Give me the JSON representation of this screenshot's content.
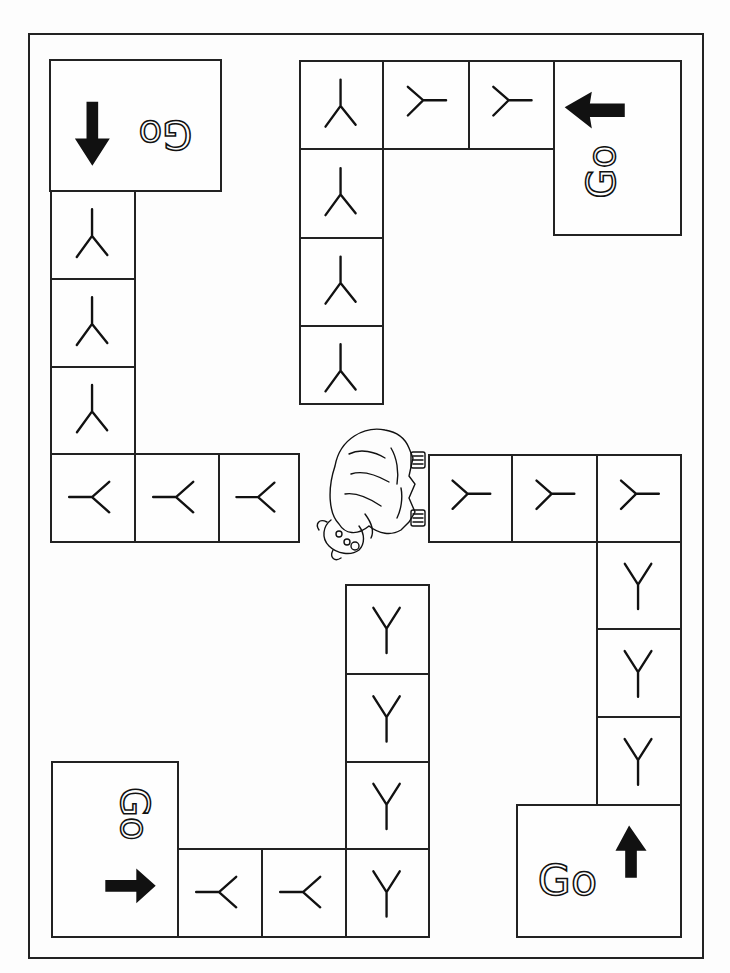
{
  "game": {
    "title": "Y board game",
    "letter": "Y",
    "start_label": "Go",
    "center_image": "yak"
  },
  "start_squares": [
    {
      "id": "top-left",
      "label": "Go",
      "arrow": "down",
      "rotation": 180
    },
    {
      "id": "top-right",
      "label": "Go",
      "arrow": "left",
      "rotation": -90
    },
    {
      "id": "bottom-left",
      "label": "Go",
      "arrow": "right",
      "rotation": 90
    },
    {
      "id": "bottom-right",
      "label": "Go",
      "arrow": "up",
      "rotation": 0
    }
  ],
  "paths": {
    "top_left": {
      "cells": 6,
      "letter": "Y"
    },
    "top_right": {
      "cells": 6,
      "letter": "Y"
    },
    "bottom_left": {
      "cells": 6,
      "letter": "Y"
    },
    "bottom_right": {
      "cells": 6,
      "letter": "Y"
    }
  },
  "colors": {
    "line": "#222222",
    "background": "#fdfdfd",
    "arrow": "#111111"
  }
}
